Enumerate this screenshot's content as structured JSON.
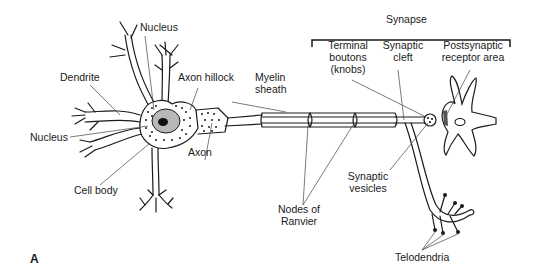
{
  "figure": {
    "panel_label": "A"
  },
  "labels": {
    "nucleus_top": "Nucleus",
    "dendrite": "Dendrite",
    "axon_hillock": "Axon hillock",
    "myelin_sheath_1": "Myelin",
    "myelin_sheath_2": "sheath",
    "nucleus_left": "Nucleus",
    "cell_body": "Cell body",
    "axon": "Axon",
    "nodes_of_ranvier_1": "Nodes of",
    "nodes_of_ranvier_2": "Ranvier",
    "synapse": "Synapse",
    "terminal_boutons_1": "Terminal",
    "terminal_boutons_2": "boutons",
    "terminal_boutons_3": "(knobs)",
    "synaptic_cleft_1": "Synaptic",
    "synaptic_cleft_2": "cleft",
    "postsynaptic_1": "Postsynaptic",
    "postsynaptic_2": "receptor area",
    "synaptic_vesicles_1": "Synaptic",
    "synaptic_vesicles_2": "vesicles",
    "telodendria": "Telodendria"
  },
  "colors": {
    "line": "#1a1a1a",
    "leader": "#444444",
    "cell_body_fill": "#ffffff",
    "nucleus_fill": "#b8b8b8",
    "nucleolus_fill": "#111111",
    "receptor_fill": "#555555"
  }
}
